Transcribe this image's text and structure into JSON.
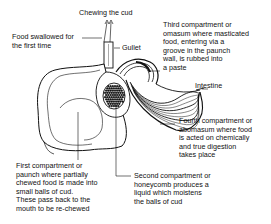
{
  "labels": {
    "chewing_cud": "Chewing the cud",
    "food_swallowed": "Food swallowed for\nthe first time",
    "gullet": "Gullet",
    "third_compartment": "Third compartment or\nomasum where masticated\nfood, entering via a\ngroove in the paunch\nwall, is rubbed into\na paste",
    "intestine": "Intestine",
    "fourth_compartment": "Fourth compartment or\nabomasum where food\nis acted on chemically\nand true digestion\ntakes place",
    "first_compartment": "First compartment or\npaunch where partially\nchewed food is made into\nsmall balls of cud.\nThese pass back to the\nmouth to be re-chewed",
    "second_compartment": "Second compartment or\nhoneycomb produces a\nliquid which moistens\nthe balls of cud"
  }
}
